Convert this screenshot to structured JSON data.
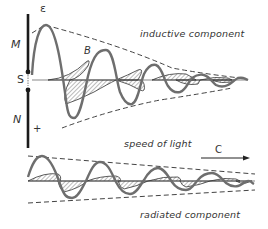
{
  "labels": {
    "electric_field": "ε",
    "magnetic_field": "B",
    "magnet_north_top": "M",
    "magnet_south": "S",
    "magnet_north": "N",
    "plus_sign": "+",
    "inductive": "inductive component",
    "speed_of_light": "speed of light",
    "c_symbol": "C",
    "radiated": "radiated component"
  },
  "colors": {
    "wave": "#6e6e6e",
    "hatch": "#555555",
    "dashed": "#444444",
    "bar": "#1a1a1a",
    "text": "#333333"
  }
}
